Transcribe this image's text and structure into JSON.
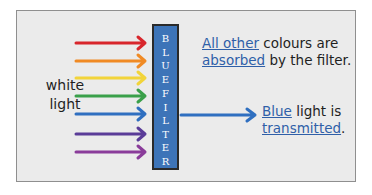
{
  "diagram": {
    "input_label_line1": "white",
    "input_label_line2": "light",
    "filter": {
      "label_word1": [
        "B",
        "L",
        "U",
        "E"
      ],
      "label_word2": [
        "F",
        "I",
        "L",
        "T",
        "E",
        "R"
      ],
      "color": "#3d74b8"
    },
    "incoming_rays": [
      {
        "color": "#d8262c",
        "name": "red"
      },
      {
        "color": "#f08a24",
        "name": "orange"
      },
      {
        "color": "#f2d43a",
        "name": "yellow"
      },
      {
        "color": "#3aa04a",
        "name": "green"
      },
      {
        "color": "#2f6fc0",
        "name": "blue"
      },
      {
        "color": "#5a3c98",
        "name": "indigo"
      },
      {
        "color": "#8a3c9a",
        "name": "violet"
      }
    ],
    "transmitted_ray": {
      "color": "#2f6fc0",
      "name": "blue"
    },
    "absorbed_note": {
      "u1": "All other",
      "t1": " colours are",
      "u2": "absorbed",
      "t2": " by the filter."
    },
    "transmitted_note": {
      "u1": "Blue",
      "t1": " light is",
      "u2": "transmitted",
      "t2": "."
    }
  }
}
